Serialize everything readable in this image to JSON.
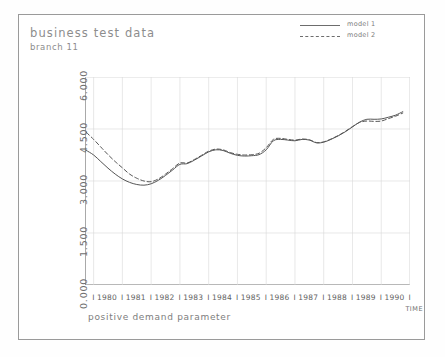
{
  "header": {
    "title": "business test data",
    "subtitle": "branch 11"
  },
  "legend": {
    "position": "top-right",
    "entries": [
      {
        "label": "model 1",
        "style": "solid"
      },
      {
        "label": "model 2",
        "style": "dashed"
      }
    ]
  },
  "axes": {
    "y_ticks": [
      "0.000",
      "1.500",
      "3.000",
      "4.500",
      "6.000"
    ],
    "x_ticks": [
      "1980",
      "1981",
      "1982",
      "1983",
      "1984",
      "1985",
      "1986",
      "1987",
      "1988",
      "1989",
      "1990"
    ],
    "x_separator": "I",
    "x_axis_label": "TIME",
    "caption": "positive demand parameter"
  },
  "colors": {
    "line": "#555555",
    "grid": "#d8d8d8",
    "axis": "#707070",
    "frame": "#9a9a9a",
    "title_text": "#8d8d8d"
  },
  "chart_data": {
    "type": "line",
    "title": "business test data",
    "subtitle": "branch 11",
    "xlabel": "TIME",
    "ylabel": "",
    "caption": "positive demand parameter",
    "xlim": [
      1979.7,
      1991.0
    ],
    "ylim": [
      0,
      6000
    ],
    "ytick_values": [
      0,
      1500,
      3000,
      4500,
      6000
    ],
    "ytick_labels": [
      "0.000",
      "1.500",
      "3.000",
      "4.500",
      "6.000"
    ],
    "xtick_labels": [
      "1980",
      "1981",
      "1982",
      "1983",
      "1984",
      "1985",
      "1986",
      "1987",
      "1988",
      "1989",
      "1990"
    ],
    "grid": true,
    "legend_position": "top-right",
    "x": [
      1979.75,
      1980.0,
      1980.25,
      1980.5,
      1980.75,
      1981.0,
      1981.25,
      1981.5,
      1981.75,
      1982.0,
      1982.25,
      1982.5,
      1982.75,
      1983.0,
      1983.25,
      1983.5,
      1983.75,
      1984.0,
      1984.25,
      1984.5,
      1984.75,
      1985.0,
      1985.25,
      1985.5,
      1985.75,
      1986.0,
      1986.25,
      1986.5,
      1986.75,
      1987.0,
      1987.25,
      1987.5,
      1987.75,
      1988.0,
      1988.25,
      1988.5,
      1988.75,
      1989.0,
      1989.25,
      1989.5,
      1989.75,
      1990.0,
      1990.25,
      1990.5,
      1990.75
    ],
    "series": [
      {
        "name": "model 1",
        "style": "solid",
        "values": [
          3880,
          3750,
          3560,
          3370,
          3200,
          3060,
          2960,
          2900,
          2880,
          2920,
          3020,
          3160,
          3320,
          3480,
          3500,
          3600,
          3720,
          3840,
          3900,
          3880,
          3800,
          3740,
          3720,
          3730,
          3760,
          3900,
          4160,
          4200,
          4180,
          4160,
          4200,
          4180,
          4100,
          4120,
          4200,
          4300,
          4420,
          4560,
          4700,
          4780,
          4780,
          4790,
          4840,
          4900,
          5000
        ]
      },
      {
        "name": "model 2",
        "style": "dashed",
        "values": [
          4400,
          4200,
          3980,
          3760,
          3560,
          3380,
          3200,
          3080,
          3000,
          2980,
          3060,
          3200,
          3360,
          3520,
          3520,
          3620,
          3740,
          3860,
          3920,
          3900,
          3820,
          3770,
          3750,
          3760,
          3800,
          3960,
          4200,
          4230,
          4200,
          4180,
          4210,
          4190,
          4110,
          4130,
          4210,
          4310,
          4430,
          4570,
          4690,
          4730,
          4720,
          4730,
          4800,
          4870,
          4960
        ]
      }
    ]
  }
}
